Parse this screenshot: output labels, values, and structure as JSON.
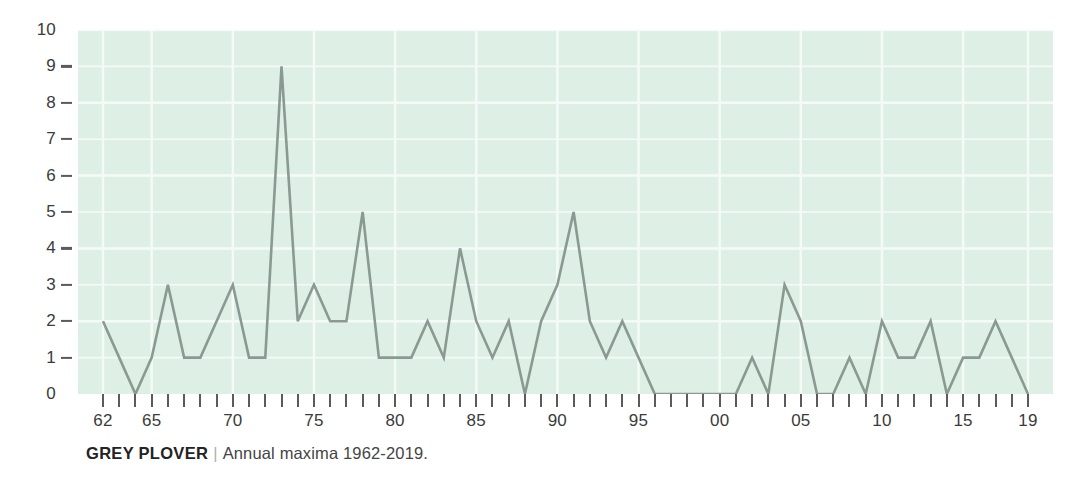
{
  "caption": {
    "species": "GREY PLOVER",
    "separator": "|",
    "description": "Annual maxima 1962-2019."
  },
  "colors": {
    "plot_background": "#deefe5",
    "gridline": "#f4fbf7",
    "line": "#8a9a92",
    "axis_text": "#3b3b3b",
    "tick": "#5b5b5b"
  },
  "chart_data": {
    "type": "line",
    "title": "GREY PLOVER",
    "subtitle": "Annual maxima 1962-2019.",
    "xlabel": "",
    "ylabel": "",
    "ylim": [
      0,
      10
    ],
    "xlim": [
      1962,
      2019
    ],
    "grid": true,
    "legend": "none",
    "y_ticks": [
      0,
      1,
      2,
      3,
      4,
      5,
      6,
      7,
      8,
      9,
      10
    ],
    "y_tick_labels": [
      "0",
      "1",
      "2",
      "3",
      "4",
      "5",
      "6",
      "7",
      "8",
      "9",
      "10"
    ],
    "x_tick_years": [
      1962,
      1963,
      1964,
      1965,
      1966,
      1967,
      1968,
      1969,
      1970,
      1971,
      1972,
      1973,
      1974,
      1975,
      1976,
      1977,
      1978,
      1979,
      1980,
      1981,
      1982,
      1983,
      1984,
      1985,
      1986,
      1987,
      1988,
      1989,
      1990,
      1991,
      1992,
      1993,
      1994,
      1995,
      1996,
      1997,
      1998,
      1999,
      2000,
      2001,
      2002,
      2003,
      2004,
      2005,
      2006,
      2007,
      2008,
      2009,
      2010,
      2011,
      2012,
      2013,
      2014,
      2015,
      2016,
      2017,
      2018,
      2019
    ],
    "x_labelled_ticks": [
      {
        "year": 1962,
        "label": "62"
      },
      {
        "year": 1965,
        "label": "65"
      },
      {
        "year": 1970,
        "label": "70"
      },
      {
        "year": 1975,
        "label": "75"
      },
      {
        "year": 1980,
        "label": "80"
      },
      {
        "year": 1985,
        "label": "85"
      },
      {
        "year": 1990,
        "label": "90"
      },
      {
        "year": 1995,
        "label": "95"
      },
      {
        "year": 2000,
        "label": "00"
      },
      {
        "year": 2005,
        "label": "05"
      },
      {
        "year": 2010,
        "label": "10"
      },
      {
        "year": 2015,
        "label": "15"
      },
      {
        "year": 2019,
        "label": "19"
      }
    ],
    "x": [
      1962,
      1963,
      1964,
      1965,
      1966,
      1967,
      1968,
      1969,
      1970,
      1971,
      1972,
      1973,
      1974,
      1975,
      1976,
      1977,
      1978,
      1979,
      1980,
      1981,
      1982,
      1983,
      1984,
      1985,
      1986,
      1987,
      1988,
      1989,
      1990,
      1991,
      1992,
      1993,
      1994,
      1995,
      1996,
      1997,
      1998,
      1999,
      2000,
      2001,
      2002,
      2003,
      2004,
      2005,
      2006,
      2007,
      2008,
      2009,
      2010,
      2011,
      2012,
      2013,
      2014,
      2015,
      2016,
      2017,
      2018,
      2019
    ],
    "values": [
      2,
      1,
      0,
      1,
      3,
      1,
      1,
      2,
      3,
      1,
      1,
      9,
      2,
      3,
      2,
      2,
      5,
      1,
      1,
      1,
      2,
      1,
      4,
      2,
      1,
      2,
      0,
      2,
      3,
      5,
      2,
      1,
      2,
      1,
      0,
      0,
      0,
      0,
      0,
      0,
      1,
      0,
      3,
      2,
      0,
      0,
      1,
      0,
      2,
      1,
      1,
      2,
      0,
      1,
      1,
      2,
      1,
      0
    ],
    "series": [
      {
        "name": "Annual maxima",
        "values": [
          2,
          1,
          0,
          1,
          3,
          1,
          1,
          2,
          3,
          1,
          1,
          9,
          2,
          3,
          2,
          2,
          5,
          1,
          1,
          1,
          2,
          1,
          4,
          2,
          1,
          2,
          0,
          2,
          3,
          5,
          2,
          1,
          2,
          1,
          0,
          0,
          0,
          0,
          0,
          0,
          1,
          0,
          3,
          2,
          0,
          0,
          1,
          0,
          2,
          1,
          1,
          2,
          0,
          1,
          1,
          2,
          1,
          0
        ]
      }
    ]
  }
}
